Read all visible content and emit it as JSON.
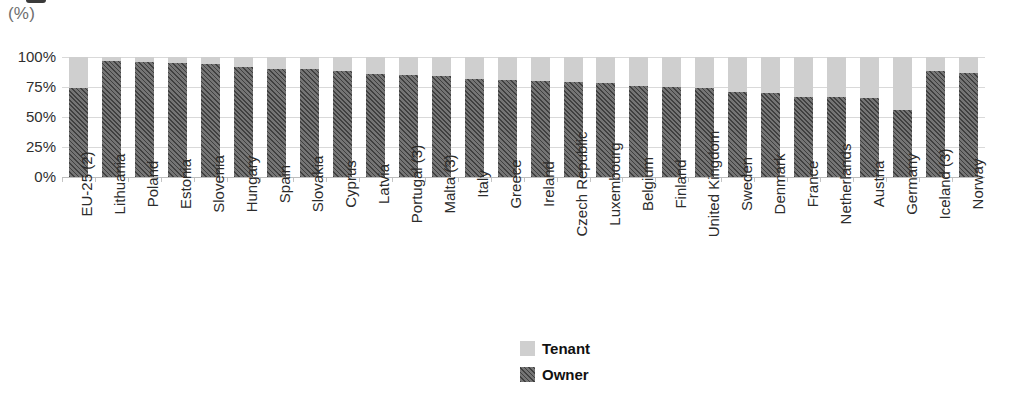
{
  "unit_label": "(%)",
  "chart_data": {
    "type": "bar",
    "subtype": "stacked-100-percent",
    "title": "",
    "xlabel": "",
    "ylabel": "(%)",
    "ylim": [
      0,
      100
    ],
    "ytick_labels": [
      "100%",
      "75%",
      "50%",
      "25%",
      "0%"
    ],
    "ytick_values": [
      100,
      75,
      50,
      25,
      0
    ],
    "grid": true,
    "legend_position": "bottom-center",
    "categories": [
      "EU-25 (2)",
      "Lithuania",
      "Poland",
      "Estonia",
      "Slovenia",
      "Hungary",
      "Spain",
      "Slovakia",
      "Cyprus",
      "Latvia",
      "Portugal (3)",
      "Malta (3)",
      "Italy",
      "Greece",
      "Ireland",
      "Czech Republic",
      "Luxembourg",
      "Belgium",
      "Finland",
      "United Kingdom",
      "Sweden",
      "Denmark",
      "France",
      "Netherlands",
      "Austria",
      "Germany",
      "Iceland (3)",
      "Norway"
    ],
    "series": [
      {
        "name": "Owner",
        "color": "#5b5b5b",
        "values": [
          74,
          97,
          96,
          95,
          94,
          92,
          90,
          90,
          88,
          86,
          85,
          84,
          82,
          81,
          80,
          79,
          78,
          76,
          75,
          74,
          71,
          70,
          67,
          67,
          66,
          56,
          88,
          87
        ]
      },
      {
        "name": "Tenant",
        "color": "#cfcfcf",
        "values": [
          26,
          3,
          4,
          5,
          6,
          8,
          10,
          10,
          12,
          14,
          15,
          16,
          18,
          19,
          20,
          21,
          22,
          24,
          25,
          26,
          29,
          30,
          33,
          33,
          34,
          44,
          12,
          13
        ]
      }
    ],
    "legend": [
      {
        "label": "Tenant",
        "color": "#cfcfcf"
      },
      {
        "label": "Owner",
        "color": "#5b5b5b"
      }
    ]
  }
}
